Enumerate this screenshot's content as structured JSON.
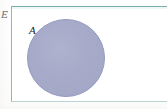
{
  "figure": {
    "kind": "venn-diagram",
    "universal_set": {
      "label": "E",
      "shape": "rectangle",
      "border_color": "#8cb9b6",
      "fill_color": "#ffffff",
      "label_position": "outside-top-left"
    },
    "sets": [
      {
        "label": "A",
        "shape": "circle",
        "fill_color": "#a5a9c8",
        "outline_color": "#9299bd",
        "label_position": "inside-upper-left",
        "center": {
          "x": 66,
          "y": 58
        },
        "radius": 39
      }
    ],
    "background_color": "#fdfdfc"
  }
}
